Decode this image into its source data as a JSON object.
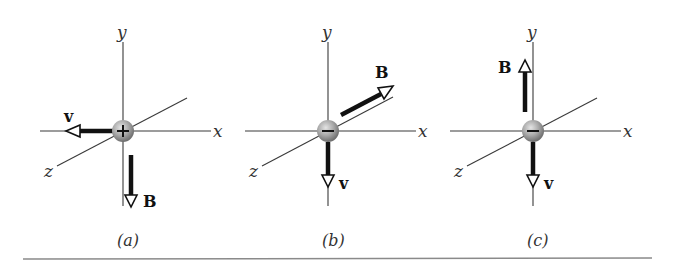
{
  "figure": {
    "panels": [
      {
        "id": "a",
        "caption": "(a)",
        "charge": "+",
        "axes": {
          "x": "x",
          "y": "y",
          "z": "z"
        },
        "vectors": [
          {
            "label": "v",
            "direction": "-x"
          },
          {
            "label": "B",
            "direction": "-y"
          }
        ]
      },
      {
        "id": "b",
        "caption": "(b)",
        "charge": "−",
        "axes": {
          "x": "x",
          "y": "y",
          "z": "z"
        },
        "vectors": [
          {
            "label": "B",
            "direction": "-z"
          },
          {
            "label": "v",
            "direction": "-y"
          }
        ]
      },
      {
        "id": "c",
        "caption": "(c)",
        "charge": "−",
        "axes": {
          "x": "x",
          "y": "y",
          "z": "z"
        },
        "vectors": [
          {
            "label": "B",
            "direction": "+y"
          },
          {
            "label": "v",
            "direction": "-y"
          }
        ]
      }
    ],
    "colors": {
      "axis": "#3a3a3a",
      "vector": "#111111",
      "particle": "#9a9a9a",
      "rule": "#8a8a8a"
    }
  }
}
